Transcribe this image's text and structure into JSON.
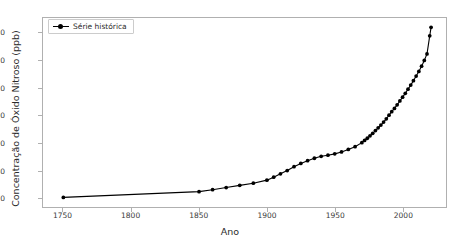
{
  "chart_data": {
    "type": "line",
    "title": "",
    "xlabel": "Ano",
    "ylabel": "Concentração de Óxido Nitroso (ppb)",
    "xlim": [
      1735,
      2032
    ],
    "ylim": [
      266.5,
      335.5
    ],
    "xticks": [
      1750,
      1800,
      1850,
      1900,
      1950,
      2000
    ],
    "yticks": [
      270,
      280,
      290,
      300,
      310,
      320,
      330
    ],
    "grid": false,
    "legend": {
      "position": "upper left",
      "entries": [
        {
          "label": "Série histórica",
          "color": "#000000",
          "marker": "circle",
          "linestyle": "solid"
        }
      ]
    },
    "series": [
      {
        "name": "Série histórica",
        "color": "#000000",
        "x": [
          1750,
          1850,
          1860,
          1870,
          1880,
          1890,
          1900,
          1905,
          1910,
          1915,
          1920,
          1925,
          1930,
          1935,
          1940,
          1945,
          1950,
          1955,
          1960,
          1965,
          1970,
          1972,
          1974,
          1976,
          1978,
          1980,
          1982,
          1984,
          1986,
          1988,
          1990,
          1992,
          1994,
          1996,
          1998,
          2000,
          2002,
          2004,
          2006,
          2008,
          2010,
          2012,
          2014,
          2016,
          2018,
          2020,
          2021
        ],
        "y": [
          270.0,
          272.1,
          272.8,
          273.6,
          274.4,
          275.2,
          276.3,
          277.4,
          278.6,
          279.8,
          281.2,
          282.4,
          283.4,
          284.3,
          285.0,
          285.4,
          285.9,
          286.6,
          287.5,
          288.5,
          290.0,
          290.8,
          291.6,
          292.5,
          293.4,
          294.4,
          295.4,
          296.4,
          297.5,
          298.7,
          300.0,
          301.3,
          302.5,
          303.8,
          305.2,
          306.6,
          308.0,
          309.5,
          311.0,
          312.6,
          314.3,
          316.0,
          317.9,
          320.0,
          322.4,
          329.0,
          332.1
        ]
      }
    ]
  },
  "axis": {
    "xlabel": "Ano",
    "ylabel": "Concentração de Óxido Nitroso (ppb)",
    "xticklabels": [
      "1750",
      "1800",
      "1850",
      "1900",
      "1950",
      "2000"
    ],
    "yticklabels": [
      "270",
      "280",
      "290",
      "300",
      "310",
      "320",
      "330"
    ]
  },
  "legend": {
    "label": "Série histórica"
  }
}
